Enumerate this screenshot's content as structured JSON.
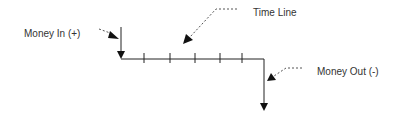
{
  "diagram": {
    "type": "cash-flow-timeline",
    "labels": {
      "money_in": "Money In (+)",
      "time_line": "Time Line",
      "money_out": "Money Out (-)"
    },
    "timeline": {
      "tick_count": 5
    },
    "colors": {
      "line": "#222222",
      "leader": "#555555",
      "text": "#333333",
      "background": "#ffffff"
    }
  }
}
